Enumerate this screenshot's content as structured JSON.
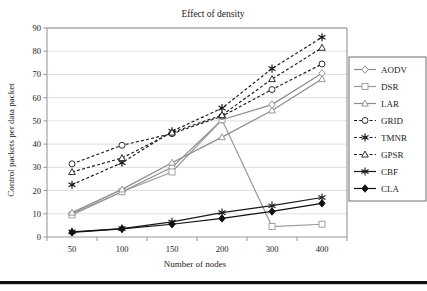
{
  "figure": {
    "background": "#ffffff",
    "bottom_rule_color": "#111111"
  },
  "chart_data": {
    "type": "line",
    "title": "Effect of density",
    "xlabel": "Number of nodes",
    "ylabel": "Control packets per data packet",
    "categories": [
      "50",
      "100",
      "150",
      "200",
      "300",
      "400"
    ],
    "ylim": [
      0,
      90
    ],
    "yticks": [
      0,
      10,
      20,
      30,
      40,
      50,
      60,
      70,
      80,
      90
    ],
    "grid": true,
    "legend_position": "right",
    "series": [
      {
        "name": "AODV",
        "values": [
          10,
          19.5,
          30,
          50.5,
          57,
          70.5
        ],
        "color": "#8c8c8c",
        "dash": "solid",
        "marker": "diamond",
        "marker_fill": "none"
      },
      {
        "name": "DSR",
        "values": [
          9.5,
          19.5,
          28,
          50.5,
          4.5,
          5.5
        ],
        "color": "#9a9a9a",
        "dash": "solid",
        "marker": "square",
        "marker_fill": "none"
      },
      {
        "name": "LAR",
        "values": [
          10.5,
          20.5,
          32,
          43,
          54.5,
          68
        ],
        "color": "#8c8c8c",
        "dash": "solid",
        "marker": "triangle",
        "marker_fill": "none"
      },
      {
        "name": "GRID",
        "values": [
          31.5,
          39.5,
          44.5,
          52,
          63.5,
          74.5
        ],
        "color": "#1a1a1a",
        "dash": "dashed",
        "marker": "circle",
        "marker_fill": "none"
      },
      {
        "name": "TMNR",
        "values": [
          22.5,
          32,
          45.5,
          55.5,
          72.5,
          86
        ],
        "color": "#1a1a1a",
        "dash": "dashed",
        "marker": "asterisk",
        "marker_fill": "solid"
      },
      {
        "name": "GPSR",
        "values": [
          28,
          34,
          45,
          52.5,
          68,
          81.5
        ],
        "color": "#1a1a1a",
        "dash": "dashed",
        "marker": "triangle",
        "marker_fill": "none"
      },
      {
        "name": "CBF",
        "values": [
          2.2,
          3.6,
          6.5,
          10.5,
          13.5,
          17
        ],
        "color": "#1a1a1a",
        "dash": "solid",
        "marker": "star",
        "marker_fill": "solid"
      },
      {
        "name": "CLA",
        "values": [
          2,
          3.5,
          5.5,
          8,
          11,
          14.5
        ],
        "color": "#111111",
        "dash": "solid",
        "marker": "diamond",
        "marker_fill": "solid"
      }
    ]
  }
}
